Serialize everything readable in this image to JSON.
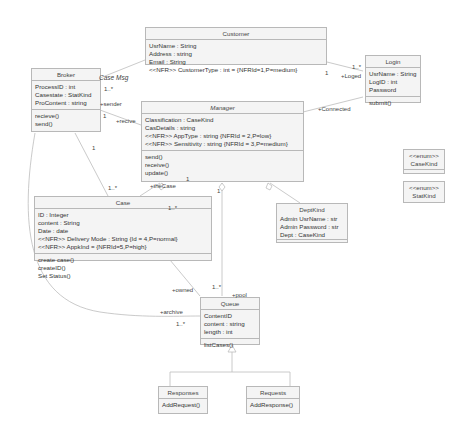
{
  "diagram": {
    "type": "uml-class-diagram",
    "classes": {
      "customer": {
        "name": "Customer",
        "attributes": [
          "UsrName : String",
          "Address : string",
          "Email : String",
          "<<NFR>> CustomerType : int = {NFRId=1,P=medium}"
        ],
        "operations": []
      },
      "login": {
        "name": "Login",
        "attributes": [
          "UsrName : String",
          "LogID : int",
          "Password"
        ],
        "operations": [
          "submit()"
        ]
      },
      "broker": {
        "name": "Broker",
        "attributes": [
          "ProcessID : int",
          "Casestate : StatKind",
          "ProContent : string"
        ],
        "operations": [
          "recieve()",
          "send()"
        ]
      },
      "manager": {
        "name": "Manager",
        "attributes": [
          "Classification : CaseKind",
          "CasDetails : string",
          "<<NFR>> AppType : string {NFRId = 2,P=low}",
          "<<NFR>> Sensitivity : string {NFRId = 3,P=medium}"
        ],
        "operations": [
          "send()",
          "receive()",
          "update()"
        ]
      },
      "case": {
        "name": "Case",
        "attributes": [
          "ID : Integer",
          "content : String",
          "Date : date",
          "<<NFR>> Delivery Mode : String {Id = 4,P=normal}",
          "<<NFR>> AppkInd = {NFRId=5,P=high}"
        ],
        "operations": [
          "create case()",
          "createID()",
          "Set Status()"
        ]
      },
      "deptkind": {
        "name": "DeptKind",
        "attributes": [
          "Admin UsrName : str",
          "Admin Password : str",
          "Dept : CaseKind"
        ],
        "operations": []
      },
      "casekind": {
        "stereotype": "<<enum>>",
        "name": "CaseKind"
      },
      "statkind": {
        "stereotype": "<<enum>>",
        "name": "StatKind"
      },
      "queue": {
        "name": "Queue",
        "attributes": [
          "ContentID",
          "content : string",
          "length : int"
        ],
        "operations": [
          "listCases()"
        ]
      },
      "responses": {
        "name": "Responses",
        "operations": [
          "AddRequest()"
        ]
      },
      "requests": {
        "name": "Requests",
        "operations": [
          "AddResponse()"
        ]
      }
    },
    "labels": {
      "customer_mult": "1",
      "login_mult": "1..*",
      "loged": "+Loged",
      "connected": "+Connected",
      "case_msg": "Case Msg",
      "broker_mult_top": "1..*",
      "sender": "+sender",
      "broker_mult_right": "1",
      "recive": "+recive",
      "broker_case_mult": "1",
      "case_mult_top": "1..*",
      "thecase": "+theCase",
      "manager_case_mult": "1",
      "case_inner_mult": "1..*",
      "owned": "+owned",
      "queue_mult_top": "1..*",
      "pool": "+pool",
      "archive": "+archive",
      "queue_mult_left": "1..*"
    }
  }
}
